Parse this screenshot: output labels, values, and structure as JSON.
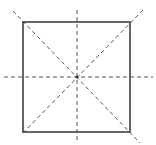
{
  "diagram": {
    "colors": {
      "stroke": "#333333",
      "dash": "#555555",
      "background": "#ffffff"
    },
    "square": {
      "x": 23,
      "y": 22,
      "w": 107,
      "h": 110
    },
    "center": {
      "x": 77,
      "y": 77
    },
    "symmetry_lines": [
      {
        "name": "vertical",
        "x1": 77,
        "y1": 10,
        "x2": 77,
        "y2": 143
      },
      {
        "name": "horizontal",
        "x1": 4,
        "y1": 77,
        "x2": 153,
        "y2": 77
      },
      {
        "name": "diagonal-1",
        "x1": 13,
        "y1": 11,
        "x2": 140,
        "y2": 143
      },
      {
        "name": "diagonal-2",
        "x1": 143,
        "y1": 10,
        "x2": 21,
        "y2": 135
      }
    ]
  }
}
